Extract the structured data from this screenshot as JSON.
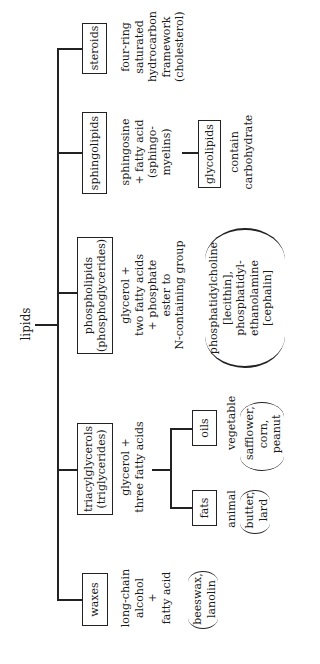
{
  "root": {
    "label": "lipids"
  },
  "categories": [
    {
      "label": "steroids",
      "description": [
        "four-ring",
        "saturated",
        "hydrocarbon",
        "framework",
        "(cholesterol)"
      ]
    },
    {
      "label": "sphingolipids",
      "description": [
        "sphingosine",
        "+ fatty acid",
        "(sphingo-",
        "myelins)"
      ],
      "child": {
        "label": "glycolipids",
        "description": [
          "contain",
          "carbohydrate"
        ]
      }
    },
    {
      "label_lines": [
        "phospholipids",
        "(phosphoglycerides)"
      ],
      "description": [
        "glycerol +",
        "two fatty acids",
        "+ phosphate",
        "ester to",
        "N-containing group"
      ],
      "examples": [
        "phosphatidylcholine",
        "[lecithin],",
        "phosphatidyl-",
        "ethanolamine",
        "[cephalin]"
      ]
    },
    {
      "label_lines": [
        "triacylglycerols",
        "(triglycerides)"
      ],
      "description": [
        "glycerol +",
        "three fatty acids"
      ],
      "children": [
        {
          "label": "oils",
          "description": [
            "vegetable"
          ],
          "examples": [
            "safflower,",
            "corn,",
            "peanut"
          ]
        },
        {
          "label": "fats",
          "description": [
            "animal"
          ],
          "examples": [
            "butter,",
            "lard"
          ]
        }
      ]
    },
    {
      "label": "waxes",
      "description": [
        "long-chain",
        "alcohol",
        "+",
        "fatty acid"
      ],
      "examples": [
        "beeswax,",
        "lanolin"
      ]
    }
  ]
}
